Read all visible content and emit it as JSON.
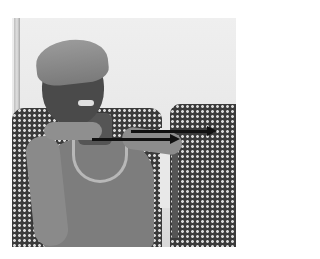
{
  "image": {
    "description": "Grayscale photograph of a woman wearing a head wrap, seated in a patterned chair, gesturing with her hands; two black arrows annotate the image",
    "photo_bounds": {
      "left": 12,
      "top": 18,
      "width": 224,
      "height": 229
    },
    "palette": {
      "background": "#ffffff",
      "arrow": "#111111",
      "wall": "#e8e8e8",
      "chair": "#3a3a3a"
    }
  },
  "annotations": {
    "arrows": [
      {
        "name": "upper-arrow",
        "x1": 131,
        "y1": 131,
        "x2": 217,
        "y2": 131,
        "direction": "right"
      },
      {
        "name": "lower-arrow",
        "x1": 92,
        "y1": 139,
        "x2": 180,
        "y2": 139,
        "direction": "right"
      }
    ]
  }
}
